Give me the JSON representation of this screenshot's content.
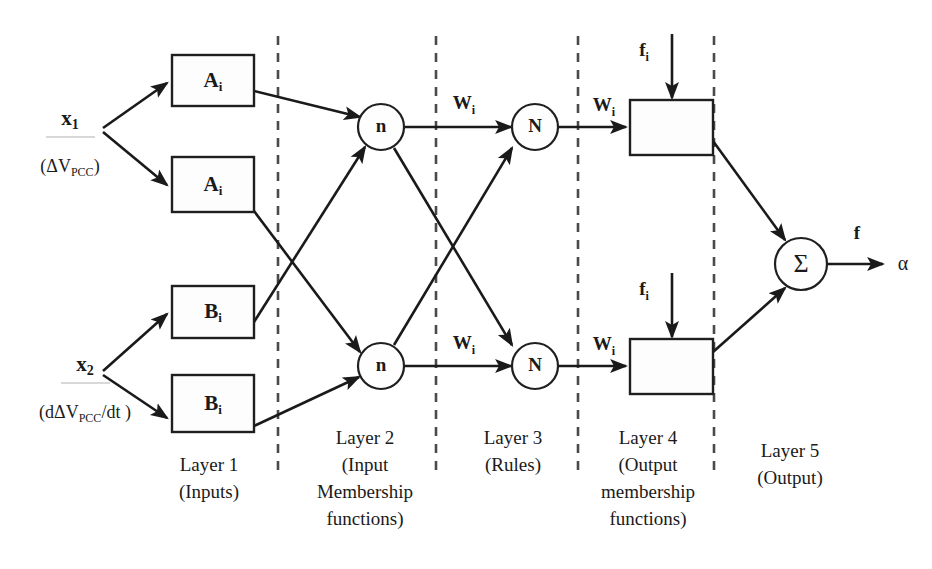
{
  "diagram": {
    "background_color": "#ffffff",
    "line_color": "#1a1a1a",
    "divider_color": "#4a4a4a"
  },
  "inputs": [
    {
      "name": "x1",
      "symbol": "x",
      "subscript": "1",
      "detail_prefix": "(ΔV",
      "detail_sub": "PCC",
      "detail_suffix": ")"
    },
    {
      "name": "x2",
      "symbol": "x",
      "subscript": "2",
      "detail_prefix": "(dΔV",
      "detail_sub": "PCC",
      "detail_suffix": "/dt )"
    }
  ],
  "membership_boxes": [
    {
      "id": "A1",
      "symbol": "A",
      "subscript": "i"
    },
    {
      "id": "A2",
      "symbol": "A",
      "subscript": "i"
    },
    {
      "id": "B1",
      "symbol": "B",
      "subscript": "i"
    },
    {
      "id": "B2",
      "symbol": "B",
      "subscript": "i"
    }
  ],
  "rule_nodes": [
    {
      "id": "n1",
      "label": "n"
    },
    {
      "id": "n2",
      "label": "n"
    }
  ],
  "norm_nodes": [
    {
      "id": "N1",
      "label": "N"
    },
    {
      "id": "N2",
      "label": "N"
    }
  ],
  "output_boxes": [
    {
      "id": "o1",
      "label": ""
    },
    {
      "id": "o2",
      "label": ""
    }
  ],
  "sum_node": {
    "id": "sum",
    "label": "Σ"
  },
  "edge_labels": {
    "w_upper_rule": {
      "symbol": "W",
      "subscript": "i"
    },
    "w_upper_norm": {
      "symbol": "W",
      "subscript": "i"
    },
    "w_lower_rule": {
      "symbol": "W",
      "subscript": "i"
    },
    "w_lower_norm": {
      "symbol": "W",
      "subscript": "i"
    },
    "f_upper": {
      "symbol": "f",
      "subscript": "i"
    },
    "f_lower": {
      "symbol": "f",
      "subscript": "i"
    },
    "f_out": {
      "symbol": "f"
    },
    "alpha_out": {
      "symbol": "α"
    }
  },
  "layers": [
    {
      "index": 1,
      "title": "Layer 1",
      "lines": [
        "(Inputs)"
      ]
    },
    {
      "index": 2,
      "title": "Layer 2",
      "lines": [
        "(Input",
        "Membership",
        "functions)"
      ]
    },
    {
      "index": 3,
      "title": "Layer 3",
      "lines": [
        "(Rules)"
      ]
    },
    {
      "index": 4,
      "title": "Layer 4",
      "lines": [
        "(Output",
        "membership",
        "functions)"
      ]
    },
    {
      "index": 5,
      "title": "Layer 5",
      "lines": [
        "(Output)"
      ]
    }
  ],
  "dividers": [
    {
      "id": "d1",
      "x": 278
    },
    {
      "id": "d2",
      "x": 436
    },
    {
      "id": "d3",
      "x": 578
    },
    {
      "id": "d4",
      "x": 714
    }
  ]
}
